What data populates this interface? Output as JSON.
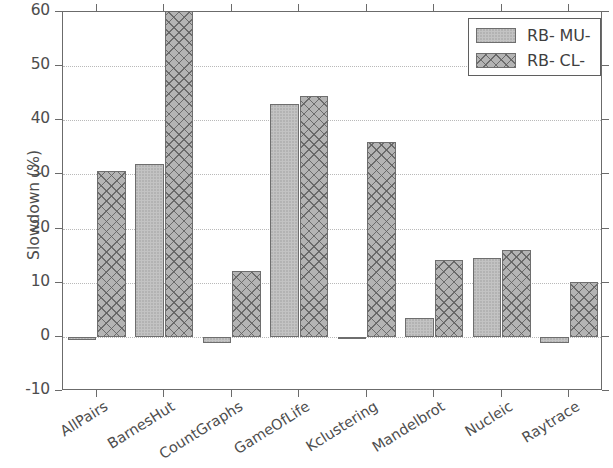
{
  "chart_data": {
    "type": "bar",
    "title": "",
    "xlabel": "",
    "ylabel": "Slowdown (%)",
    "ylim": [
      -10,
      60
    ],
    "yticks": [
      -10,
      0,
      10,
      20,
      30,
      40,
      50,
      60
    ],
    "ytick_labels": [
      "-10",
      "0",
      "10",
      "20",
      "30",
      "40",
      "50",
      "60"
    ],
    "grid": true,
    "grid_axis": "y",
    "legend_position": "upper right",
    "categories": [
      "AllPairs",
      "BarnesHut",
      "CountGraphs",
      "GameOfLife",
      "Kclustering",
      "Mandelbrot",
      "Nucleic",
      "Raytrace"
    ],
    "series": [
      {
        "name": "RB- MU-",
        "pattern": "solid-gray",
        "color": "#c3c3c3",
        "values": [
          -0.6,
          32.0,
          -1.2,
          43.0,
          -0.4,
          3.4,
          14.5,
          -1.2
        ]
      },
      {
        "name": "RB- CL-",
        "pattern": "crosshatch",
        "color": "#b4b4b4",
        "values": [
          30.6,
          64.0,
          12.2,
          44.5,
          35.9,
          14.2,
          16.0,
          10.2
        ],
        "clipped": [
          false,
          true,
          false,
          false,
          false,
          false,
          false,
          false
        ],
        "note": "BarnesHut RB-CL- bar is clipped at the top of the axis (extends above 60)"
      }
    ]
  },
  "axis": {
    "ylabel": "Slowdown (%)",
    "ytick_labels": [
      "60",
      "50",
      "40",
      "30",
      "20",
      "10",
      "0",
      "-10"
    ],
    "xtick_labels": [
      "AllPairs",
      "BarnesHut",
      "CountGraphs",
      "GameOfLife",
      "Kclustering",
      "Mandelbrot",
      "Nucleic",
      "Raytrace"
    ]
  },
  "legend": {
    "entries": [
      {
        "label": "RB- MU-"
      },
      {
        "label": "RB- CL-"
      }
    ]
  }
}
